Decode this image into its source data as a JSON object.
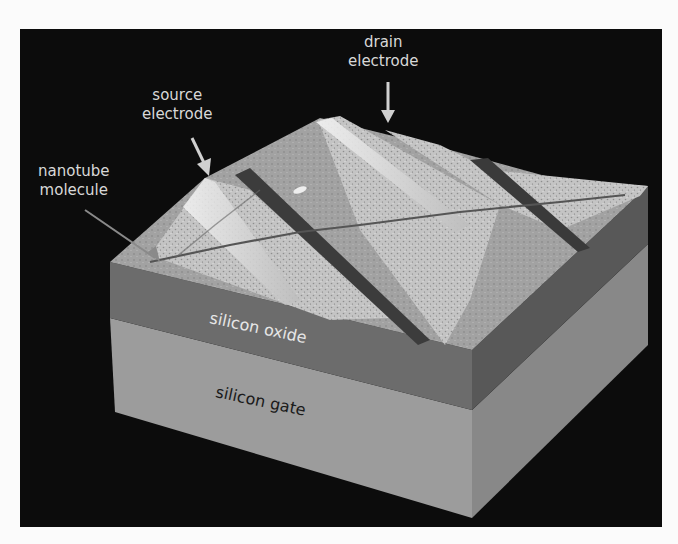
{
  "figure": {
    "background_color": "#0c0c0c",
    "page_color": "#fbfbfb"
  },
  "labels": {
    "drain": {
      "line1": "drain",
      "line2": "electrode"
    },
    "source": {
      "line1": "source",
      "line2": "electrode"
    },
    "nanotube": {
      "line1": "nanotube",
      "line2": "molecule"
    }
  },
  "layers": [
    {
      "name": "silicon oxide",
      "color": "#6a6a6a",
      "text_color": "#e6e6e6"
    },
    {
      "name": "silicon gate",
      "color": "#9a9a9a",
      "text_color": "#1a1a1a"
    }
  ],
  "colors": {
    "oxide_front": "#6c6c6c",
    "oxide_side": "#575757",
    "gate_front": "#9c9c9c",
    "gate_side": "#878787",
    "surface_light": "#c9c9c9",
    "surface_mid": "#a9a9a9",
    "electrode_gap": "#3a3a3a",
    "arrow": "#d0d0d0"
  }
}
